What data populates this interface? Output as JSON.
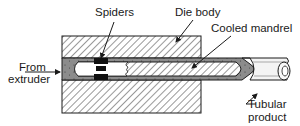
{
  "diagram": {
    "type": "cross-section schematic",
    "labels": {
      "spiders": "Spiders",
      "die_body": "Die body",
      "cooled_mandrel": "Cooled mandrel",
      "from": "From",
      "extruder": "extruder",
      "tubular": "Tubular",
      "product": "product"
    },
    "colors": {
      "background": "#ffffff",
      "outline": "#1a1a1a",
      "melt_channel": "#8a8a8a",
      "spider": "#111111",
      "hatch": "#333333",
      "tube": "#f2f2f2"
    }
  }
}
